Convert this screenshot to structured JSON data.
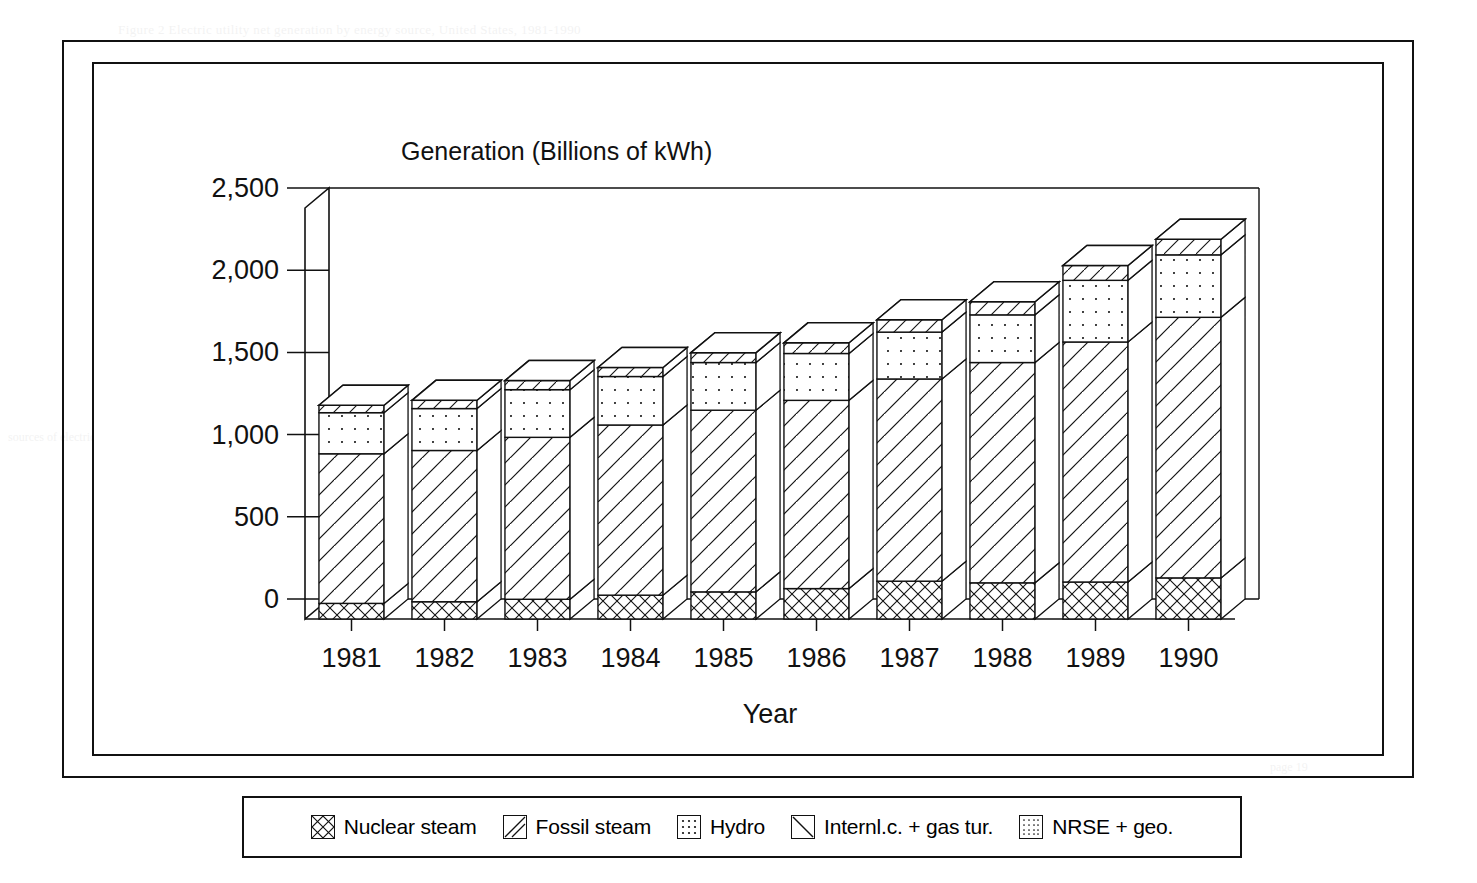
{
  "document": {
    "bleed_through": {
      "top": "Figure 2  Electric utility net generation by energy source, United States, 1981-1990",
      "right_1": "in  the  U.S.",
      "right_2": "generation  capacity",
      "right_3": "nuclear  units",
      "left_1": "sources  of  electric",
      "bottom_1": "page  19"
    }
  },
  "chart": {
    "y_axis_title": "Generation (Billions of kWh)",
    "x_axis_title": "Year"
  },
  "chart_data": {
    "type": "bar",
    "subtype": "stacked-3d-column",
    "title": "",
    "xlabel": "Year",
    "ylabel": "Generation (Billions of kWh)",
    "ylim": [
      0,
      2500
    ],
    "yticks": [
      0,
      500,
      1000,
      1500,
      2000,
      2500
    ],
    "ytick_labels": [
      "0",
      "500",
      "1,000",
      "1,500",
      "2,000",
      "2,500"
    ],
    "grid": false,
    "legend_position": "below-plot",
    "categories": [
      "1981",
      "1982",
      "1983",
      "1984",
      "1985",
      "1986",
      "1987",
      "1988",
      "1989",
      "1990"
    ],
    "series": [
      {
        "name": "Nuclear steam",
        "pattern": "cross-hatch",
        "values": [
          273,
          283,
          294,
          328,
          384,
          414,
          455,
          527,
          529,
          577
        ]
      },
      {
        "name": "Fossil steam",
        "pattern": "diagonal-forward",
        "values": [
          1448,
          1456,
          1520,
          1566,
          1631,
          1645,
          1743,
          1832,
          1913,
          1930
        ]
      },
      {
        "name": "Hydro",
        "pattern": "dots-coarse",
        "values": [
          261,
          309,
          332,
          321,
          281,
          291,
          250,
          223,
          266,
          280
        ]
      },
      {
        "name": "Internl.c. + gas tur.",
        "pattern": "diagonal-back",
        "values": [
          43,
          39,
          38,
          45,
          50,
          52,
          60,
          66,
          88,
          94
        ]
      },
      {
        "name": "NRSE + geo.",
        "pattern": "dots-fine",
        "values": [
          14,
          15,
          17,
          19,
          21,
          23,
          26,
          28,
          30,
          32
        ]
      }
    ],
    "bar_totals": [
      1300,
      1330,
      1450,
      1530,
      1620,
      1680,
      1820,
      1930,
      2150,
      2310
    ],
    "segments_by_year": [
      {
        "year": "1981",
        "nuclear": 95,
        "fossil": 910,
        "hydro": 250,
        "other": 45
      },
      {
        "year": "1982",
        "nuclear": 105,
        "fossil": 920,
        "hydro": 255,
        "other": 50
      },
      {
        "year": "1983",
        "nuclear": 120,
        "fossil": 985,
        "hydro": 290,
        "other": 55
      },
      {
        "year": "1984",
        "nuclear": 145,
        "fossil": 1035,
        "hydro": 295,
        "other": 55
      },
      {
        "year": "1985",
        "nuclear": 165,
        "fossil": 1105,
        "hydro": 290,
        "other": 60
      },
      {
        "year": "1986",
        "nuclear": 185,
        "fossil": 1145,
        "hydro": 285,
        "other": 65
      },
      {
        "year": "1987",
        "nuclear": 230,
        "fossil": 1230,
        "hydro": 285,
        "other": 75
      },
      {
        "year": "1988",
        "nuclear": 220,
        "fossil": 1340,
        "hydro": 290,
        "other": 80
      },
      {
        "year": "1989",
        "nuclear": 225,
        "fossil": 1460,
        "hydro": 375,
        "other": 90
      },
      {
        "year": "1990",
        "nuclear": 250,
        "fossil": 1585,
        "hydro": 380,
        "other": 95
      }
    ]
  },
  "legend": {
    "items": [
      {
        "label": "Nuclear steam",
        "pattern": "cross-hatch",
        "icon": "swatch-crosshatch-icon"
      },
      {
        "label": "Fossil steam",
        "pattern": "diagonal-forward",
        "icon": "swatch-diagonal-forward-icon"
      },
      {
        "label": "Hydro",
        "pattern": "dots-coarse",
        "icon": "swatch-dots-coarse-icon"
      },
      {
        "label": "Internl.c. + gas tur.",
        "pattern": "diagonal-back",
        "icon": "swatch-diagonal-back-icon"
      },
      {
        "label": "NRSE + geo.",
        "pattern": "dots-fine",
        "icon": "swatch-dots-fine-icon"
      }
    ]
  },
  "colors": {
    "ink": "#111111",
    "paper": "#ffffff"
  }
}
